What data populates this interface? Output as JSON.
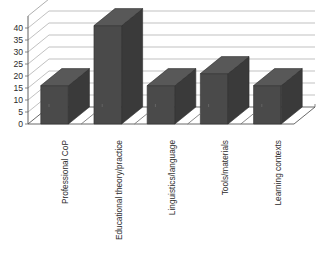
{
  "chart_data": {
    "type": "bar",
    "title": "",
    "subtitle": "",
    "xlabel": "",
    "ylabel": "",
    "categories": [
      "Professional CoP",
      "Educational theory/practice",
      "Linguistics/language",
      "Tools/materials",
      "Learning contexts"
    ],
    "values": [
      16,
      41,
      16,
      21,
      16
    ],
    "series": [
      {
        "name": "",
        "values": [
          16,
          41,
          16,
          21,
          16
        ]
      }
    ],
    "ylim": [
      0,
      45
    ],
    "ytick_labels": [
      "0",
      "5",
      "10",
      "15",
      "20",
      "25",
      "30",
      "35",
      "40"
    ],
    "ytick_values": [
      0,
      5,
      10,
      15,
      20,
      25,
      30,
      35,
      40
    ],
    "ytick_step": 5,
    "grid": true,
    "grid_axis": "y",
    "legend": false,
    "legend_position": "none",
    "annotations": [],
    "style": {
      "three_d": true,
      "bar_face_color": "#4a4a4a",
      "bar_side_color": "#3a3a3a",
      "bar_top_color": "#585858",
      "bar_outline_color": "#2f2f2f",
      "gridline_color": "#a6a6a6",
      "axis_color": "#4f4f4f",
      "label_color": "#2b2b2b",
      "plot_background": "#ffffff",
      "category_label_rotation": -90
    }
  }
}
